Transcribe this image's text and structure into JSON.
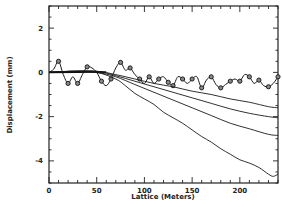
{
  "chart_data": {
    "type": "line",
    "title": "",
    "xlabel": "Lattice (Meters)",
    "ylabel": "Displacement (mm)",
    "xlim": [
      0,
      240
    ],
    "ylim": [
      -5,
      3
    ],
    "xticks": [
      0,
      50,
      100,
      150,
      200
    ],
    "yticks": [
      2,
      0,
      -2,
      -4
    ],
    "grid": false,
    "legend": null,
    "series": [
      {
        "name": "oscillating (marked)",
        "marker": "circle",
        "x": [
          0,
          5,
          10,
          15,
          20,
          25,
          30,
          35,
          40,
          45,
          50,
          55,
          60,
          65,
          70,
          75,
          80,
          85,
          90,
          95,
          100,
          105,
          110,
          115,
          120,
          125,
          130,
          135,
          140,
          145,
          150,
          155,
          160,
          165,
          170,
          175,
          180,
          185,
          190,
          195,
          200,
          205,
          210,
          215,
          220,
          225,
          230,
          235,
          240
        ],
        "y": [
          0.0,
          0.15,
          0.5,
          -0.1,
          -0.5,
          -0.2,
          -0.5,
          -0.1,
          0.25,
          0.2,
          0.0,
          -0.4,
          -0.6,
          -0.3,
          0.2,
          0.45,
          0.1,
          0.2,
          -0.1,
          -0.3,
          -0.5,
          -0.2,
          -0.5,
          -0.3,
          -0.2,
          -0.45,
          -0.6,
          -0.2,
          -0.3,
          -0.5,
          -0.3,
          -0.2,
          -0.7,
          -0.35,
          -0.2,
          -0.55,
          -0.7,
          -0.55,
          -0.4,
          -0.3,
          -0.4,
          -0.1,
          -0.2,
          -0.5,
          -0.35,
          -0.6,
          -0.65,
          -0.5,
          -0.2
        ],
        "marker_x": [
          10,
          20,
          30,
          40,
          55,
          65,
          75,
          85,
          95,
          105,
          115,
          125,
          130,
          140,
          150,
          160,
          170,
          180,
          190,
          200,
          210,
          220,
          230,
          240
        ],
        "marker_y": [
          0.5,
          -0.5,
          -0.5,
          0.25,
          -0.4,
          -0.3,
          0.45,
          0.2,
          -0.3,
          -0.2,
          -0.3,
          -0.45,
          -0.6,
          -0.3,
          -0.3,
          -0.7,
          -0.2,
          -0.7,
          -0.4,
          -0.4,
          -0.2,
          -0.35,
          -0.65,
          -0.2
        ]
      },
      {
        "name": "curve 1",
        "x": [
          0,
          25,
          50,
          70,
          90,
          110,
          130,
          150,
          170,
          190,
          210,
          230,
          240
        ],
        "y": [
          0.0,
          0.05,
          0.05,
          -0.1,
          -0.3,
          -0.5,
          -0.65,
          -0.85,
          -1.0,
          -1.2,
          -1.35,
          -1.55,
          -1.6
        ]
      },
      {
        "name": "curve 2",
        "x": [
          0,
          25,
          50,
          70,
          90,
          110,
          130,
          150,
          170,
          190,
          210,
          230,
          240
        ],
        "y": [
          0.0,
          0.05,
          0.05,
          -0.15,
          -0.4,
          -0.65,
          -0.9,
          -1.15,
          -1.4,
          -1.65,
          -1.85,
          -2.0,
          -2.05
        ]
      },
      {
        "name": "curve 3",
        "x": [
          0,
          25,
          50,
          70,
          90,
          110,
          130,
          150,
          170,
          190,
          210,
          230,
          240
        ],
        "y": [
          0.0,
          0.05,
          0.0,
          -0.2,
          -0.55,
          -0.9,
          -1.25,
          -1.6,
          -1.95,
          -2.3,
          -2.55,
          -2.8,
          -2.85
        ]
      },
      {
        "name": "curve 4",
        "x": [
          0,
          25,
          50,
          70,
          80,
          90,
          100,
          110,
          120,
          130,
          140,
          150,
          160,
          170,
          180,
          190,
          200,
          210,
          220,
          230,
          235,
          240
        ],
        "y": [
          0.0,
          0.05,
          0.0,
          -0.3,
          -0.6,
          -0.95,
          -1.2,
          -1.45,
          -1.8,
          -2.05,
          -2.3,
          -2.6,
          -2.9,
          -3.15,
          -3.45,
          -3.7,
          -3.95,
          -4.1,
          -4.3,
          -4.6,
          -4.7,
          -4.6
        ]
      }
    ]
  }
}
